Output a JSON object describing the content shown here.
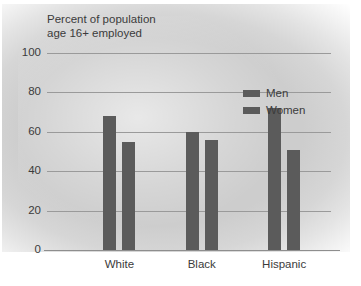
{
  "chart_data": {
    "type": "bar",
    "title": "Percent of population age 16+ employed",
    "title_line1": "Percent of population",
    "title_line2": "age 16+ employed",
    "xlabel": "",
    "ylabel": "",
    "ylim": [
      0,
      100
    ],
    "yticks": [
      0,
      20,
      40,
      60,
      80,
      100
    ],
    "ytick_labels": [
      "0",
      "20",
      "40",
      "60",
      "80",
      "100"
    ],
    "grid": true,
    "legend_position": "upper right",
    "categories": [
      "White",
      "Black",
      "Hispanic"
    ],
    "series": [
      {
        "name": "Men",
        "color": "#5b5b5b",
        "values": [
          68,
          60,
          72
        ]
      },
      {
        "name": "Women",
        "color": "#5b5b5b",
        "values": [
          55,
          56,
          51
        ]
      }
    ],
    "bar_color": "#5b5b5b",
    "plot_background": "#cdcdcd",
    "axis_color": "#9a9a9a",
    "text_color": "#3b3b3b"
  },
  "legend": {
    "items": [
      {
        "label": "Men"
      },
      {
        "label": "Women"
      }
    ]
  }
}
